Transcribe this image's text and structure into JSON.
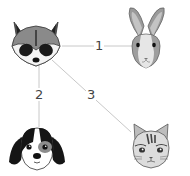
{
  "diagram": {
    "nodes": [
      {
        "id": "raccoon",
        "label": "raccoon"
      },
      {
        "id": "rabbit",
        "label": "rabbit"
      },
      {
        "id": "dog",
        "label": "dog"
      },
      {
        "id": "cat",
        "label": "cat"
      }
    ],
    "edges": [
      {
        "from": "raccoon",
        "to": "rabbit",
        "label": "1"
      },
      {
        "from": "raccoon",
        "to": "dog",
        "label": "2"
      },
      {
        "from": "raccoon",
        "to": "cat",
        "label": "3"
      }
    ],
    "colors": {
      "line": "#c8c8c8",
      "label": "#444444"
    }
  }
}
